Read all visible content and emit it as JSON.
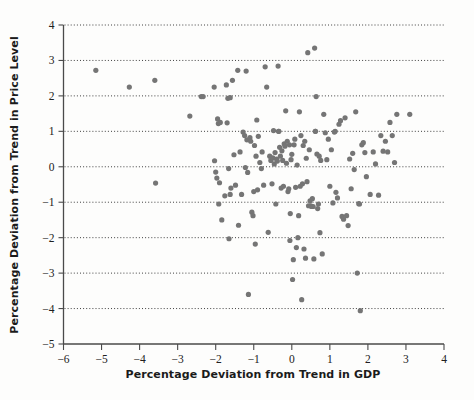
{
  "chart_data": {
    "type": "scatter",
    "title": "",
    "xlabel": "Percentage Deviation from Trend in GDP",
    "ylabel": "Percentage Deviation from Trend in Price Level",
    "xlim": [
      -6,
      4
    ],
    "ylim": [
      -5,
      4
    ],
    "xticks": [
      -6,
      -5,
      -4,
      -3,
      -2,
      -1,
      0,
      1,
      2,
      3,
      4
    ],
    "xtick_labels": [
      "−6",
      "−5",
      "−4",
      "−3",
      "−2",
      "−1",
      "0",
      "1",
      "2",
      "3",
      "4"
    ],
    "yticks": [
      -5,
      -4,
      -3,
      -2,
      -1,
      0,
      1,
      2,
      3,
      4
    ],
    "ytick_labels": [
      "−5",
      "−4",
      "−3",
      "−2",
      "−1",
      "0",
      "1",
      "2",
      "3",
      "4"
    ],
    "grid": "horizontal-dotted",
    "gridlines_y": [
      -4,
      -3,
      -2,
      -1,
      0,
      1,
      2,
      3,
      4
    ],
    "legend": "none",
    "marker": {
      "shape": "circle",
      "color": "#757575",
      "size_px": 5.2
    },
    "n_points": 172,
    "points": [
      [
        -5.15,
        2.72
      ],
      [
        -4.27,
        2.25
      ],
      [
        -3.6,
        2.44
      ],
      [
        -3.58,
        -0.46
      ],
      [
        -2.68,
        1.43
      ],
      [
        -2.38,
        1.98
      ],
      [
        -2.33,
        1.98
      ],
      [
        -2.04,
        2.25
      ],
      [
        -2.03,
        0.17
      ],
      [
        -2.0,
        -0.15
      ],
      [
        -1.97,
        -0.32
      ],
      [
        -1.95,
        1.35
      ],
      [
        -1.93,
        1.22
      ],
      [
        -1.92,
        -1.05
      ],
      [
        -1.9,
        -0.45
      ],
      [
        -1.88,
        1.25
      ],
      [
        -1.84,
        -1.5
      ],
      [
        -1.76,
        -0.82
      ],
      [
        -1.72,
        2.31
      ],
      [
        -1.7,
        1.24
      ],
      [
        -1.68,
        1.93
      ],
      [
        -1.66,
        -0.05
      ],
      [
        -1.65,
        -2.03
      ],
      [
        -1.62,
        -0.78
      ],
      [
        -1.6,
        -0.6
      ],
      [
        -1.56,
        2.44
      ],
      [
        -1.52,
        0.34
      ],
      [
        -1.48,
        -0.52
      ],
      [
        -1.42,
        2.72
      ],
      [
        -1.4,
        -1.65
      ],
      [
        -1.36,
        0.42
      ],
      [
        -1.32,
        -0.78
      ],
      [
        -1.28,
        0.98
      ],
      [
        -1.24,
        0.88
      ],
      [
        -1.22,
        -0.02
      ],
      [
        -1.2,
        2.7
      ],
      [
        -1.18,
        0.76
      ],
      [
        -1.16,
        -0.16
      ],
      [
        -1.14,
        -3.6
      ],
      [
        -1.1,
        0.82
      ],
      [
        -1.08,
        0.72
      ],
      [
        -1.05,
        -1.28
      ],
      [
        -1.02,
        -1.38
      ],
      [
        -1.0,
        -0.7
      ],
      [
        -0.98,
        0.6
      ],
      [
        -0.96,
        -2.18
      ],
      [
        -0.94,
        0.3
      ],
      [
        -0.92,
        1.32
      ],
      [
        -0.9,
        -0.65
      ],
      [
        -0.88,
        0.86
      ],
      [
        -0.84,
        0.12
      ],
      [
        -0.8,
        -0.05
      ],
      [
        -0.78,
        0.42
      ],
      [
        -0.74,
        -0.52
      ],
      [
        -0.7,
        2.82
      ],
      [
        -0.66,
        2.25
      ],
      [
        -0.62,
        -1.85
      ],
      [
        -0.58,
        0.3
      ],
      [
        -0.55,
        0.18
      ],
      [
        -0.52,
        -0.48
      ],
      [
        -0.5,
        0.25
      ],
      [
        -0.48,
        1.02
      ],
      [
        -0.46,
        0.08
      ],
      [
        -0.44,
        0.4
      ],
      [
        -0.42,
        -1.05
      ],
      [
        -0.4,
        0.22
      ],
      [
        -0.38,
        0.16
      ],
      [
        -0.36,
        2.84
      ],
      [
        -0.34,
        1.0
      ],
      [
        -0.32,
        0.55
      ],
      [
        -0.3,
        0.3
      ],
      [
        -0.28,
        -0.6
      ],
      [
        -0.26,
        0.45
      ],
      [
        -0.24,
        0.18
      ],
      [
        -0.22,
        -0.55
      ],
      [
        -0.2,
        0.65
      ],
      [
        -0.18,
        0.58
      ],
      [
        -0.16,
        1.58
      ],
      [
        -0.14,
        0.1
      ],
      [
        -0.12,
        0.72
      ],
      [
        -0.1,
        -0.7
      ],
      [
        -0.08,
        -0.62
      ],
      [
        -0.06,
        0.62
      ],
      [
        -0.05,
        -2.08
      ],
      [
        -0.04,
        -1.32
      ],
      [
        -0.02,
        0.2
      ],
      [
        0.0,
        0.35
      ],
      [
        0.02,
        -3.18
      ],
      [
        0.04,
        -2.62
      ],
      [
        0.06,
        0.62
      ],
      [
        0.08,
        0.78
      ],
      [
        0.1,
        -0.58
      ],
      [
        0.12,
        -2.28
      ],
      [
        0.14,
        0.05
      ],
      [
        0.16,
        -2.0
      ],
      [
        0.18,
        -1.38
      ],
      [
        0.2,
        1.55
      ],
      [
        0.22,
        -0.55
      ],
      [
        0.24,
        0.88
      ],
      [
        0.26,
        -3.75
      ],
      [
        0.28,
        -0.48
      ],
      [
        0.3,
        0.6
      ],
      [
        0.32,
        -2.32
      ],
      [
        0.34,
        0.72
      ],
      [
        0.36,
        -2.58
      ],
      [
        0.38,
        0.24
      ],
      [
        0.4,
        -0.42
      ],
      [
        0.42,
        3.22
      ],
      [
        0.44,
        -1.1
      ],
      [
        0.46,
        0.48
      ],
      [
        0.48,
        -0.96
      ],
      [
        0.5,
        -1.1
      ],
      [
        0.52,
        -1.12
      ],
      [
        0.54,
        -0.9
      ],
      [
        0.56,
        -1.12
      ],
      [
        0.58,
        -2.6
      ],
      [
        0.6,
        3.35
      ],
      [
        0.62,
        1.0
      ],
      [
        0.64,
        1.98
      ],
      [
        0.66,
        0.36
      ],
      [
        0.68,
        -1.18
      ],
      [
        0.7,
        -1.05
      ],
      [
        0.72,
        0.3
      ],
      [
        0.74,
        -1.86
      ],
      [
        0.76,
        0.18
      ],
      [
        0.8,
        -2.46
      ],
      [
        0.84,
        1.48
      ],
      [
        0.88,
        0.96
      ],
      [
        0.92,
        0.2
      ],
      [
        0.96,
        0.78
      ],
      [
        1.0,
        -0.55
      ],
      [
        1.04,
        0.48
      ],
      [
        1.08,
        -1.02
      ],
      [
        1.12,
        0.98
      ],
      [
        1.16,
        -0.72
      ],
      [
        1.2,
        -0.88
      ],
      [
        1.24,
        1.2
      ],
      [
        1.28,
        1.3
      ],
      [
        1.32,
        -1.4
      ],
      [
        1.36,
        -1.48
      ],
      [
        1.4,
        1.38
      ],
      [
        1.44,
        -1.38
      ],
      [
        1.48,
        -1.66
      ],
      [
        1.52,
        0.22
      ],
      [
        1.56,
        -0.62
      ],
      [
        1.6,
        0.38
      ],
      [
        1.64,
        -0.08
      ],
      [
        1.68,
        1.55
      ],
      [
        1.72,
        -3.0
      ],
      [
        1.76,
        -1.04
      ],
      [
        1.78,
        -1.05
      ],
      [
        1.8,
        -4.06
      ],
      [
        1.84,
        0.62
      ],
      [
        1.88,
        0.68
      ],
      [
        1.92,
        0.4
      ],
      [
        1.96,
        -0.28
      ],
      [
        2.06,
        -0.78
      ],
      [
        2.14,
        0.42
      ],
      [
        2.2,
        0.08
      ],
      [
        2.28,
        -0.8
      ],
      [
        2.34,
        0.88
      ],
      [
        2.4,
        0.44
      ],
      [
        2.46,
        0.72
      ],
      [
        2.52,
        0.42
      ],
      [
        2.58,
        1.25
      ],
      [
        2.64,
        0.88
      ],
      [
        2.7,
        0.12
      ],
      [
        2.76,
        1.48
      ],
      [
        3.1,
        1.48
      ],
      [
        0.62,
        1.0
      ],
      [
        1.14,
        1.0
      ],
      [
        -0.35,
        1.0
      ],
      [
        -1.62,
        1.95
      ]
    ]
  }
}
